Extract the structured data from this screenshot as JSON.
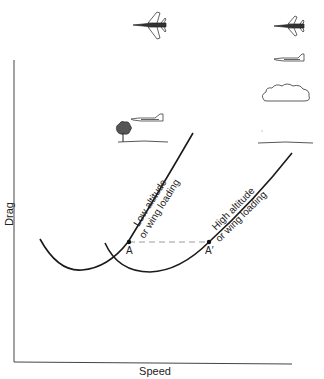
{
  "diagram": {
    "type": "drag vs speed curves",
    "axes": {
      "y_label": "Drag",
      "x_label": "Speed"
    },
    "curves": [
      {
        "id": "low",
        "label_line1": "Low altitude",
        "label_line2": "or wing loading",
        "point_label": "A"
      },
      {
        "id": "high",
        "label_line1": "High altitude",
        "label_line2": "or wing loading",
        "point_label": "A′"
      }
    ],
    "connector": "dashed horizontal line from A to A′",
    "icons": [
      "fighter-jet-top-view-icon",
      "fighter-jet-top-view-small-icon",
      "jet-side-view-high-icon",
      "cloud-icon",
      "jet-side-view-low-icon",
      "tree-icon",
      "ground-line-low",
      "ground-line-high"
    ],
    "colors": {
      "line": "#1a1a1a",
      "dashed": "#9a9a9a",
      "axis": "#444444"
    }
  }
}
